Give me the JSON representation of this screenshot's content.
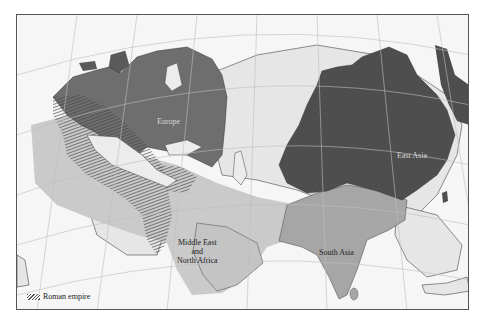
{
  "map": {
    "type": "historical-regions-map",
    "colors": {
      "ocean": "#f6f6f6",
      "land_unclassified": "#e4e4e4",
      "europe": "#6e6e6e",
      "east_asia": "#4e4e4e",
      "middle_east_north_africa": "#c9c9c9",
      "south_asia": "#a6a6a6",
      "roman_hatch": "#555555",
      "graticule": "#bdbdbd",
      "border": "#555555"
    },
    "regions": [
      {
        "id": "europe",
        "label": "Europe"
      },
      {
        "id": "east-asia",
        "label": "East Asia"
      },
      {
        "id": "middle-east-north-africa",
        "label_lines": [
          "Middle East",
          "and",
          "North Africa"
        ]
      },
      {
        "id": "south-asia",
        "label": "South Asia"
      }
    ],
    "legend": {
      "items": [
        {
          "pattern": "hatched",
          "label": "Roman empire"
        }
      ]
    }
  }
}
